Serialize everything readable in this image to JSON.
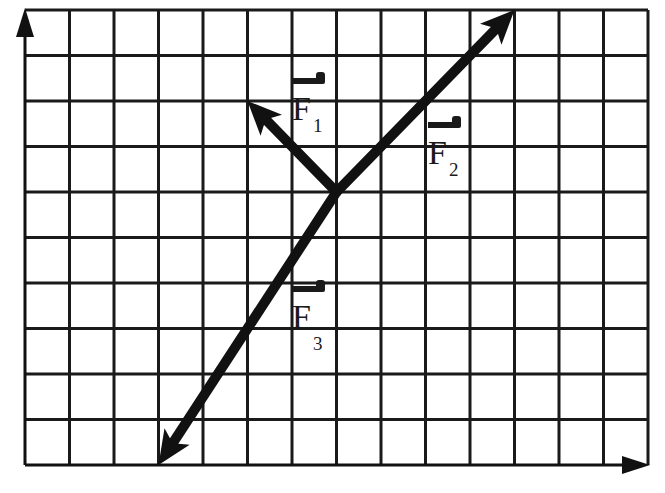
{
  "diagram": {
    "type": "force-vectors-on-grid",
    "colors": {
      "grid": "#1a1a1a",
      "vector": "#111111",
      "background": "#ffffff"
    },
    "grid": {
      "left": 25,
      "right": 648,
      "top": 10,
      "bottom": 465,
      "columns": 14,
      "rows": 10
    },
    "axes": {
      "y_axis": {
        "arrow": "up",
        "label": ""
      },
      "x_axis": {
        "arrow": "right",
        "label": ""
      }
    },
    "origin": {
      "col": 7,
      "row": 4
    },
    "vectors": [
      {
        "name": "F1",
        "symbol": "F",
        "subscript": "1",
        "dx_cells": -2,
        "dy_cells": 2
      },
      {
        "name": "F2",
        "symbol": "F",
        "subscript": "2",
        "dx_cells": 4,
        "dy_cells": 4
      },
      {
        "name": "F3",
        "symbol": "F",
        "subscript": "3",
        "dx_cells": -4,
        "dy_cells": -6
      }
    ]
  },
  "labels": {
    "f1": {
      "symbol": "F",
      "subscript": "1"
    },
    "f2": {
      "symbol": "F",
      "subscript": "2"
    },
    "f3": {
      "symbol": "F",
      "subscript": "3"
    }
  }
}
